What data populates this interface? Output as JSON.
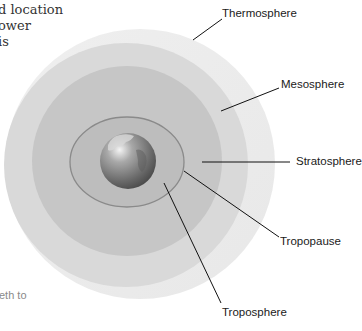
{
  "left_text_fragments": [
    "d location",
    "ower",
    "is"
  ],
  "top_text_fragment": "p  p         g",
  "bottom_left_fragment": "eth to",
  "diagram": {
    "layers": [
      {
        "name": "Thermosphere",
        "color": "#ebebeb"
      },
      {
        "name": "Mesosphere",
        "color": "#d9d9d9"
      },
      {
        "name": "Stratosphere",
        "color": "#c4c4c4"
      },
      {
        "name": "Tropopause",
        "color": "#8e8e8e"
      },
      {
        "name": "Troposphere",
        "color": "#b8b8b8"
      }
    ],
    "labels": {
      "thermosphere": "Thermosphere",
      "mesosphere": "Mesosphere",
      "stratosphere": "Stratosphere",
      "tropopause": "Tropopause",
      "troposphere": "Troposphere"
    },
    "center_object": "earth-globe"
  }
}
